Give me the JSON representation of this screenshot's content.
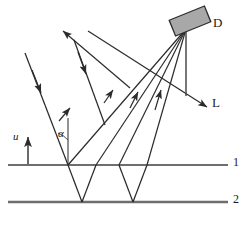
{
  "figure": {
    "type": "optics-ray-diagram",
    "canvas": {
      "width": 249,
      "height": 227,
      "background": "#ffffff"
    }
  },
  "labels": {
    "detector": "D",
    "light_source_direction": "L",
    "plane_top": "1",
    "plane_bottom": "2",
    "velocity": "u",
    "angle": "α"
  },
  "colors": {
    "ray_stroke": "#2b2b2b",
    "plane_stroke": "#6e6e6e",
    "detector_fill": "#a8a8a8",
    "detector_stroke": "#2b2b2b",
    "text": "#1a1a1a"
  },
  "geometry": {
    "planes": [
      {
        "name": "1",
        "y": 165,
        "x1": 8,
        "x2": 228
      },
      {
        "name": "2",
        "y": 202,
        "x1": 8,
        "x2": 228
      }
    ],
    "detector": {
      "cx": 190,
      "cy": 21,
      "w": 36,
      "h": 16,
      "rotation_deg": -22
    },
    "detector_stem": {
      "x1": 186,
      "y1": 29,
      "x2": 186,
      "y2": 104
    },
    "normal_line": {
      "x": 68,
      "y1": 118,
      "y2": 165
    },
    "velocity_arrow": {
      "x": 28,
      "y1": 163,
      "y2": 136
    },
    "alpha_deg": 22,
    "reflection_vertices": [
      {
        "x": 68,
        "y": 165
      },
      {
        "x": 82,
        "y": 202
      },
      {
        "x": 96,
        "y": 165
      },
      {
        "x": 119,
        "y": 165
      },
      {
        "x": 133,
        "y": 202
      },
      {
        "x": 147,
        "y": 165
      }
    ],
    "incident_rays": [
      {
        "x1": 25,
        "y1": 53,
        "x2": 68,
        "y2": 165
      },
      {
        "x1": 72,
        "y1": 42,
        "x2": 96,
        "y2": 105
      }
    ],
    "rays_to_detector_origins": [
      {
        "x": 68,
        "y": 110
      },
      {
        "x": 111,
        "y": 78
      },
      {
        "x": 144,
        "y": 93
      },
      {
        "x": 164,
        "y": 85
      }
    ],
    "escaping_ray": {
      "x1": 126,
      "y1": 100,
      "x2": 63,
      "y2": 31
    },
    "L_direction_arrow": {
      "x1": 88,
      "y1": 30,
      "x2": 208,
      "y2": 107
    }
  }
}
